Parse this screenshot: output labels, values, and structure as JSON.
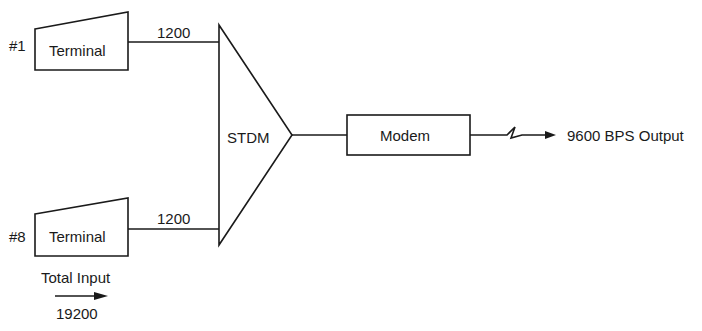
{
  "diagram": {
    "terminals": [
      {
        "id": "#1",
        "label": "Terminal",
        "rate": "1200"
      },
      {
        "id": "#8",
        "label": "Terminal",
        "rate": "1200"
      }
    ],
    "multiplexer": {
      "label": "STDM"
    },
    "modem": {
      "label": "Modem"
    },
    "output": {
      "label": "9600 BPS Output"
    },
    "total_input": {
      "label": "Total Input",
      "value": "19200"
    }
  },
  "colors": {
    "stroke": "#1a1a1a",
    "background": "#ffffff"
  }
}
